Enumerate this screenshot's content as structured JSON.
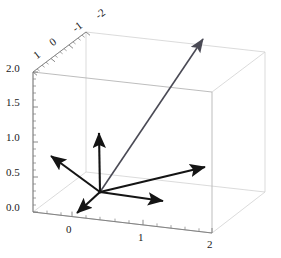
{
  "figure": {
    "kind": "3d-vector-plot",
    "background": "#ffffff",
    "box_color": "#c8c8c8",
    "axis_color": "#8a8a8a",
    "vector_color": "#141414",
    "diagonal_vector_color": "#4a4a55",
    "width": 281,
    "height": 258
  },
  "chart_data": {
    "type": "scatter",
    "title": "",
    "xlabel": "",
    "ylabel": "",
    "zlabel": "",
    "grid": true,
    "legend": null,
    "projection": "3d-orthographic",
    "axes": {
      "x": {
        "name": "x-axis-front-bottom",
        "ticks": [
          0,
          1,
          2
        ],
        "tick_labels": [
          "0",
          "1",
          "2"
        ],
        "range": [
          -0.5,
          2
        ]
      },
      "y": {
        "name": "y-axis-top-rear",
        "ticks": [
          1,
          0,
          -1,
          -2
        ],
        "tick_labels": [
          "1",
          "0",
          "-1",
          "-2"
        ],
        "range": [
          1,
          -2
        ]
      },
      "z": {
        "name": "z-axis-left-vertical",
        "ticks": [
          0.0,
          0.5,
          1.0,
          1.5,
          2.0
        ],
        "tick_labels": [
          "0.0",
          "0.5",
          "1.0",
          "1.5",
          "2.0"
        ],
        "range": [
          0,
          2
        ]
      }
    },
    "origin_px": [
      100,
      192
    ],
    "series": [
      {
        "name": "vector-up-z",
        "kind": "arrow",
        "from_px": [
          100,
          192
        ],
        "to_px": [
          99,
          131
        ],
        "color": "#141414",
        "width": 2.2
      },
      {
        "name": "vector-up-left",
        "kind": "arrow",
        "from_px": [
          100,
          192
        ],
        "to_px": [
          49,
          154
        ],
        "color": "#141414",
        "width": 2.2
      },
      {
        "name": "vector-right-horizontal",
        "kind": "arrow",
        "from_px": [
          100,
          192
        ],
        "to_px": [
          166,
          201
        ],
        "color": "#141414",
        "width": 2.2
      },
      {
        "name": "vector-right-up",
        "kind": "arrow",
        "from_px": [
          100,
          192
        ],
        "to_px": [
          209,
          166
        ],
        "color": "#141414",
        "width": 2.2
      },
      {
        "name": "vector-down-left-short",
        "kind": "arrow",
        "from_px": [
          100,
          192
        ],
        "to_px": [
          74,
          216
        ],
        "color": "#141414",
        "width": 2.2
      },
      {
        "name": "vector-diagonal-long",
        "kind": "arrow",
        "from_px": [
          100,
          192
        ],
        "to_px": [
          203,
          39
        ],
        "color": "#4a4a55",
        "width": 1.6
      }
    ],
    "box_corners_px": {
      "front_bottom_left": [
        33,
        212
      ],
      "front_bottom_right": [
        212,
        233
      ],
      "front_top_left": [
        33,
        72
      ],
      "front_top_right": [
        212,
        92
      ],
      "back_bottom_left": [
        86,
        172
      ],
      "back_bottom_right": [
        265,
        192
      ],
      "back_top_left": [
        86,
        32
      ],
      "back_top_right": [
        265,
        52
      ]
    }
  },
  "tick_labels": {
    "z_axis": [
      {
        "text": "0.0",
        "x": 6,
        "y": 202
      },
      {
        "text": "0.5",
        "x": 6,
        "y": 167
      },
      {
        "text": "1.0",
        "x": 6,
        "y": 132
      },
      {
        "text": "1.5",
        "x": 6,
        "y": 97
      },
      {
        "text": "2.0",
        "x": 6,
        "y": 63
      }
    ],
    "x_axis": [
      {
        "text": "0",
        "x": 66,
        "y": 224
      },
      {
        "text": "1",
        "x": 138,
        "y": 232
      },
      {
        "text": "2",
        "x": 207,
        "y": 239
      }
    ],
    "y_axis": [
      {
        "text": "1",
        "x": 38,
        "y": 50
      },
      {
        "text": "0",
        "x": 54,
        "y": 37
      },
      {
        "text": "-1",
        "x": 77,
        "y": 23
      },
      {
        "text": "-2",
        "x": 100,
        "y": 10
      }
    ]
  }
}
